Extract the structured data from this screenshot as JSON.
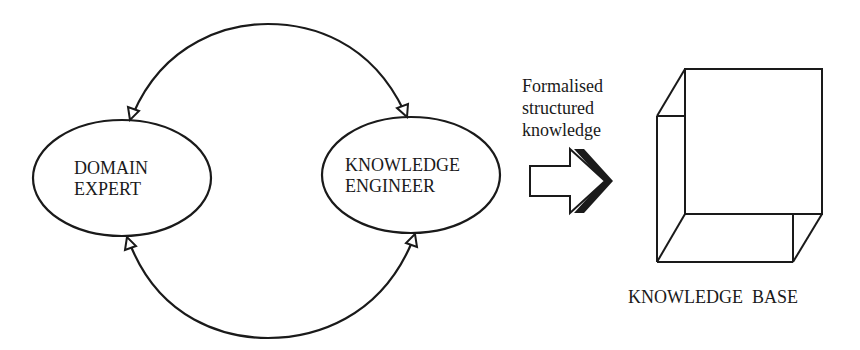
{
  "diagram": {
    "nodes": {
      "domain_expert": {
        "line1": "DOMAIN",
        "line2": "EXPERT"
      },
      "knowledge_engineer": {
        "line1": "KNOWLEDGE",
        "line2": "ENGINEER"
      },
      "knowledge_base": {
        "label": "KNOWLEDGE  BASE"
      }
    },
    "flow_label": {
      "line1": "Formalised",
      "line2": "structured",
      "line3": "knowledge"
    },
    "edges": [
      {
        "from": "domain_expert",
        "to": "knowledge_engineer",
        "style": "bidirectional-arc-top"
      },
      {
        "from": "domain_expert",
        "to": "knowledge_engineer",
        "style": "bidirectional-arc-bottom"
      },
      {
        "from": "knowledge_engineer",
        "to": "knowledge_base",
        "style": "block-arrow"
      }
    ],
    "colors": {
      "stroke": "#1a1a1a",
      "background": "#ffffff"
    }
  }
}
